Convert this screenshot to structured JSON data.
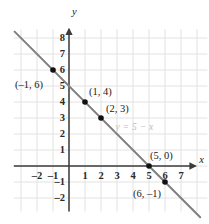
{
  "chart_data": {
    "type": "line",
    "title": "",
    "xlabel": "x",
    "ylabel": "y",
    "equation_label": "y = 5 − x",
    "equation": "y = 5 - x",
    "slope": -1,
    "intercept": 5,
    "xlim": [
      -3.4,
      8.6
    ],
    "ylim": [
      -2.9,
      8.6
    ],
    "grid": true,
    "legend": "none",
    "x_ticks": [
      "–2",
      "–1",
      "1",
      "2",
      "3",
      "4",
      "5",
      "6",
      "7"
    ],
    "x_tick_values": [
      -2,
      -1,
      1,
      2,
      3,
      4,
      5,
      6,
      7
    ],
    "y_ticks": [
      "8",
      "7",
      "6",
      "5",
      "4",
      "3",
      "2",
      "1",
      "–1",
      "–2"
    ],
    "y_tick_values": [
      8,
      7,
      6,
      5,
      4,
      3,
      2,
      1,
      -1,
      -2
    ],
    "points": [
      {
        "label": "(–1, 6)",
        "x": -1,
        "y": 6
      },
      {
        "label": "(1, 4)",
        "x": 1,
        "y": 4
      },
      {
        "label": "(2, 3)",
        "x": 2,
        "y": 3
      },
      {
        "label": "(5, 0)",
        "x": 5,
        "y": 0
      },
      {
        "label": "(6, –1)",
        "x": 6,
        "y": -1
      }
    ],
    "line_endpoints": {
      "x1": -3.4,
      "y1": 8.4,
      "x2": 8.2,
      "y2": -3.2
    },
    "colors": {
      "line": "#7f7f7f",
      "point": "#111111",
      "axis": "#3b3b3b",
      "grid": "#e2e2e2",
      "equation_text": "#bdbdbd",
      "background": "#ffffff"
    }
  }
}
